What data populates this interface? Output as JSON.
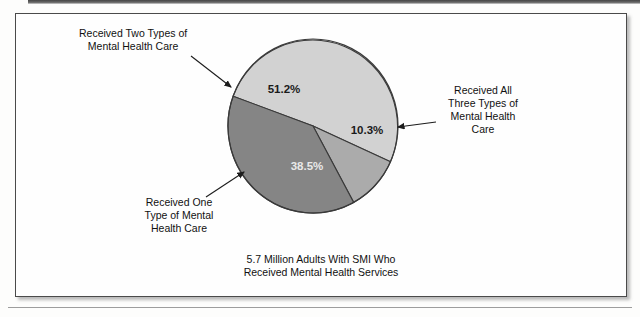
{
  "figure": {
    "caption_line1": "5.7 Million Adults With SMI Who",
    "caption_line2": "Received Mental Health Services"
  },
  "callouts": {
    "two_types": {
      "line1": "Received Two Types of",
      "line2": "Mental Health Care"
    },
    "all_three": {
      "line1": "Received All",
      "line2": "Three Types of",
      "line3": "Mental Health",
      "line4": "Care"
    },
    "one_type": {
      "line1": "Received One",
      "line2": "Type of Mental",
      "line3": "Health Care"
    }
  },
  "chart_data": {
    "type": "pie",
    "title": "5.7 Million Adults With SMI Who Received Mental Health Services",
    "categories": [
      "Received Two Types of Mental Health Care",
      "Received One Type of Mental Health Care",
      "Received All Three Types of Mental Health Care"
    ],
    "values": [
      51.2,
      38.5,
      10.3
    ],
    "labels": [
      "51.2%",
      "38.5%",
      "10.3%"
    ],
    "colors": [
      "#d2d2d2",
      "#858585",
      "#ababab"
    ],
    "units": "percent",
    "legend": "none",
    "grid": false,
    "start_angle_deg": 200,
    "direction": "clockwise"
  }
}
